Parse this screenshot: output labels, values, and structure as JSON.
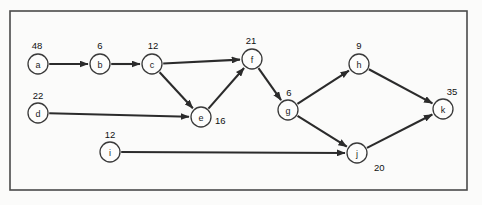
{
  "figure": {
    "kind": "directed-graph",
    "background_color": "#fbfbfa",
    "border_color": "#4a4a4a",
    "node_fill": "#fdfdfc",
    "node_stroke": "#3a3a3a",
    "edge_color": "#2b2b2b"
  },
  "frame": {
    "x": 10,
    "y": 11,
    "width": 457,
    "height": 179
  },
  "chart_data": {
    "type": "diagram",
    "title": "",
    "nodes": [
      {
        "id": "a",
        "label": "a",
        "weight": "48",
        "x": 38,
        "y": 64,
        "r": 10,
        "weight_x": 37,
        "weight_y": 45,
        "weight_anchor": "middle"
      },
      {
        "id": "b",
        "label": "b",
        "weight": "6",
        "x": 100,
        "y": 64,
        "r": 10,
        "weight_x": 100,
        "weight_y": 45,
        "weight_anchor": "middle"
      },
      {
        "id": "c",
        "label": "c",
        "weight": "12",
        "x": 152,
        "y": 64,
        "r": 10,
        "weight_x": 153,
        "weight_y": 45,
        "weight_anchor": "middle"
      },
      {
        "id": "d",
        "label": "d",
        "weight": "22",
        "x": 38,
        "y": 113,
        "r": 10,
        "weight_x": 38,
        "weight_y": 95,
        "weight_anchor": "middle"
      },
      {
        "id": "e",
        "label": "e",
        "weight": "16",
        "x": 201,
        "y": 117,
        "r": 10,
        "weight_x": 215,
        "weight_y": 120,
        "weight_anchor": "start"
      },
      {
        "id": "f",
        "label": "f",
        "weight": "21",
        "x": 252,
        "y": 59,
        "r": 10,
        "weight_x": 251,
        "weight_y": 40,
        "weight_anchor": "middle"
      },
      {
        "id": "g",
        "label": "g",
        "weight": "6",
        "x": 288,
        "y": 110,
        "r": 10,
        "weight_x": 289,
        "weight_y": 92,
        "weight_anchor": "middle"
      },
      {
        "id": "h",
        "label": "h",
        "weight": "9",
        "x": 359,
        "y": 64,
        "r": 10,
        "weight_x": 359,
        "weight_y": 45,
        "weight_anchor": "middle"
      },
      {
        "id": "i",
        "label": "i",
        "weight": "12",
        "x": 110,
        "y": 152,
        "r": 10,
        "weight_x": 110,
        "weight_y": 134,
        "weight_anchor": "middle"
      },
      {
        "id": "j",
        "label": "j",
        "weight": "20",
        "x": 357,
        "y": 153,
        "r": 10,
        "weight_x": 374,
        "weight_y": 167,
        "weight_anchor": "start"
      },
      {
        "id": "k",
        "label": "k",
        "weight": "35",
        "x": 443,
        "y": 109,
        "r": 10,
        "weight_x": 452,
        "weight_y": 91,
        "weight_anchor": "middle"
      }
    ],
    "edges": [
      {
        "from": "a",
        "to": "b"
      },
      {
        "from": "b",
        "to": "c"
      },
      {
        "from": "c",
        "to": "f"
      },
      {
        "from": "c",
        "to": "e"
      },
      {
        "from": "d",
        "to": "e"
      },
      {
        "from": "e",
        "to": "f"
      },
      {
        "from": "f",
        "to": "g"
      },
      {
        "from": "g",
        "to": "h"
      },
      {
        "from": "g",
        "to": "j"
      },
      {
        "from": "h",
        "to": "k"
      },
      {
        "from": "i",
        "to": "j"
      },
      {
        "from": "j",
        "to": "k"
      }
    ]
  }
}
